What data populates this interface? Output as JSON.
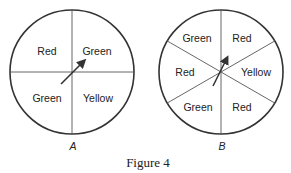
{
  "figure_caption": "Figure 4",
  "spinners": [
    {
      "name": "A",
      "sections": [
        {
          "label": "Red",
          "position": "upper-left"
        },
        {
          "label": "Green",
          "position": "upper-right"
        },
        {
          "label": "Green",
          "position": "lower-left"
        },
        {
          "label": "Yellow",
          "position": "lower-right"
        }
      ]
    },
    {
      "name": "B",
      "sections": [
        {
          "label": "Green",
          "position": "upper-left"
        },
        {
          "label": "Red",
          "position": "upper-right"
        },
        {
          "label": "Red",
          "position": "left"
        },
        {
          "label": "Yellow",
          "position": "right"
        },
        {
          "label": "Green",
          "position": "lower-left"
        },
        {
          "label": "Red",
          "position": "lower-right"
        }
      ]
    }
  ]
}
